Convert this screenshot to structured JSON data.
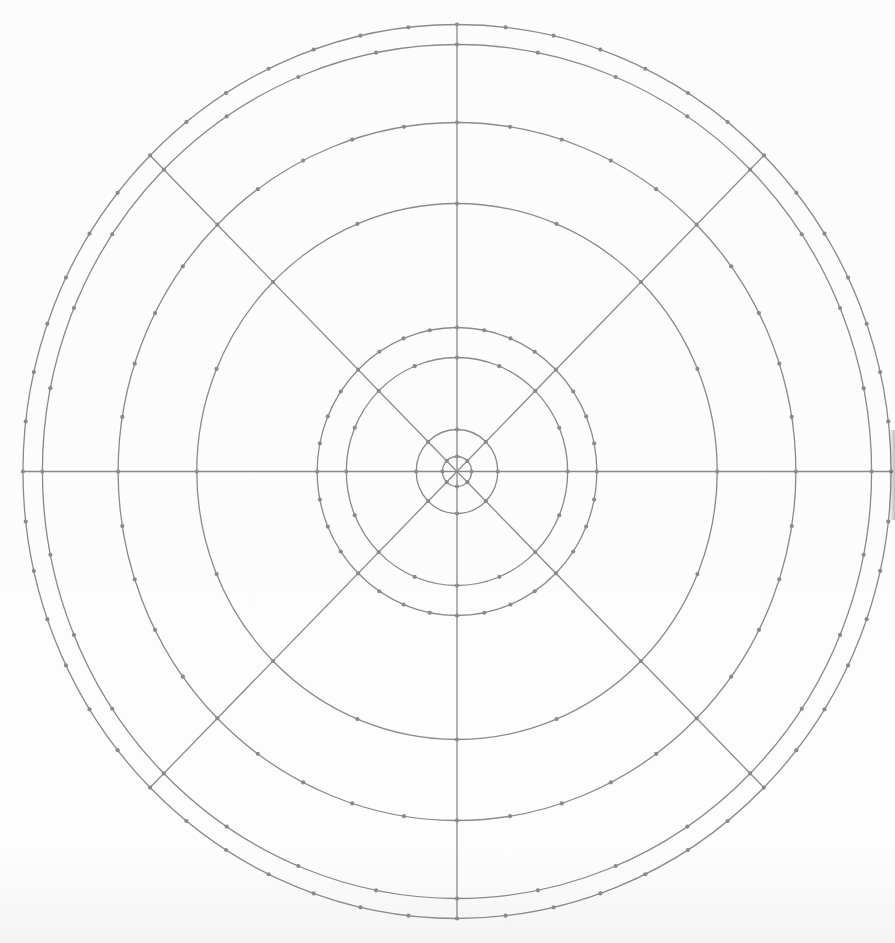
{
  "diagram": {
    "type": "polar-grid",
    "center": {
      "x": 457,
      "y": 471.5
    },
    "aspect_x": 0.971,
    "stroke_color": "#8a8a8a",
    "dot_color": "#8a8a8a",
    "stroke_width": 1.3,
    "dot_radius": 2.1,
    "radial_lines": {
      "angles_deg": [
        0,
        45,
        90,
        135,
        180,
        225,
        270,
        315
      ],
      "extent_radius": 447
    },
    "rings": [
      {
        "radius": 15,
        "dots": 8
      },
      {
        "radius": 42,
        "dots": 8
      },
      {
        "radius": 114,
        "dots": 16
      },
      {
        "radius": 144,
        "dots": 32
      },
      {
        "radius": 268,
        "dots": 16
      },
      {
        "radius": 349,
        "dots": 40
      },
      {
        "radius": 427,
        "dots": 32
      },
      {
        "radius": 447,
        "dots": 56
      }
    ]
  }
}
